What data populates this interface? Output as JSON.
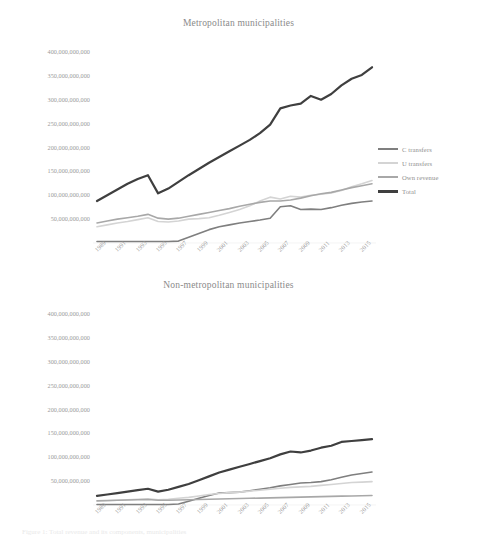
{
  "figure": {
    "caption": "Figure 1: Total revenue and its components, municipalities"
  },
  "legend_labels": [
    "C transfers",
    "U transfers",
    "Own revenue",
    "Total"
  ],
  "series_colors": {
    "c_transfers": "#7f7f7f",
    "u_transfers": "#d4d4d4",
    "own_revenue": "#a8a8a8",
    "total": "#3f3f3f"
  },
  "axis": {
    "ylabels": [
      "400,000,000,000",
      "350,000,000,000",
      "300,000,000,000",
      "250,000,000,000",
      "200,000,000,000",
      "150,000,000,000",
      "100,000,000,000",
      "50,000,000,000"
    ],
    "xlabels": [
      "1989",
      "1991",
      "1993",
      "1995",
      "1997",
      "1999",
      "2001",
      "2003",
      "2005",
      "2007",
      "2009",
      "2011",
      "2013",
      "2015"
    ]
  },
  "chart_data": [
    {
      "type": "line",
      "title": "Metropolitan municipalities",
      "xlabel": "",
      "ylabel": "",
      "ylim": [
        0,
        400000000000
      ],
      "yticks": [
        50000000000,
        100000000000,
        150000000000,
        200000000000,
        250000000000,
        300000000000,
        350000000000,
        400000000000
      ],
      "grid": false,
      "legend_position": "right",
      "x": [
        1989,
        1990,
        1991,
        1992,
        1993,
        1994,
        1995,
        1996,
        1997,
        1998,
        1999,
        2000,
        2001,
        2002,
        2003,
        2004,
        2005,
        2006,
        2007,
        2008,
        2009,
        2010,
        2011,
        2012,
        2013,
        2014,
        2015,
        2016
      ],
      "xtick_labels": [
        "1989",
        "1991",
        "1993",
        "1995",
        "1997",
        "1999",
        "2001",
        "2003",
        "2005",
        "2007",
        "2009",
        "2011",
        "2013",
        "2015"
      ],
      "series": [
        {
          "name": "C transfers",
          "values": [
            3000000000,
            3000000000,
            3000000000,
            3000000000,
            3000000000,
            3000000000,
            3000000000,
            3000000000,
            4000000000,
            12000000000,
            20000000000,
            28000000000,
            34000000000,
            38000000000,
            42000000000,
            45000000000,
            48000000000,
            52000000000,
            76000000000,
            78000000000,
            70000000000,
            71000000000,
            70000000000,
            74000000000,
            79000000000,
            83000000000,
            86000000000,
            88000000000
          ]
        },
        {
          "name": "U transfers",
          "values": [
            34000000000,
            38000000000,
            42000000000,
            45000000000,
            49000000000,
            53000000000,
            45000000000,
            44000000000,
            46000000000,
            50000000000,
            51000000000,
            53000000000,
            58000000000,
            64000000000,
            70000000000,
            78000000000,
            88000000000,
            96000000000,
            92000000000,
            98000000000,
            96000000000,
            100000000000,
            102000000000,
            105000000000,
            110000000000,
            118000000000,
            124000000000,
            131000000000
          ]
        },
        {
          "name": "Own revenue",
          "values": [
            42000000000,
            46000000000,
            50000000000,
            53000000000,
            56000000000,
            60000000000,
            52000000000,
            50000000000,
            52000000000,
            56000000000,
            60000000000,
            64000000000,
            68000000000,
            72000000000,
            77000000000,
            81000000000,
            85000000000,
            88000000000,
            88000000000,
            90000000000,
            94000000000,
            99000000000,
            103000000000,
            106000000000,
            111000000000,
            116000000000,
            120000000000,
            124000000000
          ]
        },
        {
          "name": "Total",
          "values": [
            88000000000,
            100000000000,
            112000000000,
            124000000000,
            134000000000,
            142000000000,
            104000000000,
            114000000000,
            128000000000,
            142000000000,
            155000000000,
            168000000000,
            180000000000,
            192000000000,
            204000000000,
            216000000000,
            230000000000,
            248000000000,
            282000000000,
            288000000000,
            292000000000,
            308000000000,
            300000000000,
            312000000000,
            330000000000,
            344000000000,
            352000000000,
            368000000000
          ]
        }
      ]
    },
    {
      "type": "line",
      "title": "Non-metropolitan municipalities",
      "xlabel": "",
      "ylabel": "",
      "ylim": [
        0,
        400000000000
      ],
      "yticks": [
        50000000000,
        100000000000,
        150000000000,
        200000000000,
        250000000000,
        300000000000,
        350000000000,
        400000000000
      ],
      "grid": false,
      "legend_position": "right",
      "x": [
        1989,
        1990,
        1991,
        1992,
        1993,
        1994,
        1995,
        1996,
        1997,
        1998,
        1999,
        2000,
        2001,
        2002,
        2003,
        2004,
        2005,
        2006,
        2007,
        2008,
        2009,
        2010,
        2011,
        2012,
        2013,
        2014,
        2015,
        2016
      ],
      "xtick_labels": [
        "1989",
        "1991",
        "1993",
        "1995",
        "1997",
        "1999",
        "2001",
        "2003",
        "2005",
        "2007",
        "2009",
        "2011",
        "2013",
        "2015"
      ],
      "series": [
        {
          "name": "C transfers",
          "values": [
            1000000000,
            1000000000,
            1000000000,
            1000000000,
            1000000000,
            1000000000,
            1000000000,
            1000000000,
            2000000000,
            8000000000,
            14000000000,
            20000000000,
            25000000000,
            26000000000,
            27000000000,
            30000000000,
            33000000000,
            36000000000,
            40000000000,
            43000000000,
            46000000000,
            47000000000,
            49000000000,
            53000000000,
            58000000000,
            63000000000,
            66000000000,
            69000000000
          ]
        },
        {
          "name": "U transfers",
          "values": [
            8000000000,
            9000000000,
            10000000000,
            11000000000,
            12000000000,
            13000000000,
            11000000000,
            12000000000,
            14000000000,
            16000000000,
            19000000000,
            22000000000,
            24000000000,
            26000000000,
            27000000000,
            29000000000,
            31000000000,
            33000000000,
            35000000000,
            37000000000,
            38000000000,
            39000000000,
            41000000000,
            43000000000,
            45000000000,
            47000000000,
            48000000000,
            49000000000
          ]
        },
        {
          "name": "Own revenue",
          "values": [
            9000000000,
            9500000000,
            10000000000,
            10500000000,
            11000000000,
            11500000000,
            10000000000,
            10000000000,
            10500000000,
            11000000000,
            11500000000,
            12000000000,
            12500000000,
            13000000000,
            13500000000,
            14000000000,
            14500000000,
            15000000000,
            15500000000,
            16000000000,
            16500000000,
            17000000000,
            17500000000,
            18000000000,
            18500000000,
            19000000000,
            19500000000,
            20000000000
          ]
        },
        {
          "name": "Total",
          "values": [
            19000000000,
            22000000000,
            25000000000,
            28000000000,
            31000000000,
            34000000000,
            28000000000,
            32000000000,
            38000000000,
            44000000000,
            52000000000,
            60000000000,
            68000000000,
            74000000000,
            80000000000,
            86000000000,
            92000000000,
            98000000000,
            106000000000,
            112000000000,
            110000000000,
            114000000000,
            120000000000,
            124000000000,
            132000000000,
            134000000000,
            136000000000,
            138000000000
          ]
        }
      ]
    }
  ]
}
